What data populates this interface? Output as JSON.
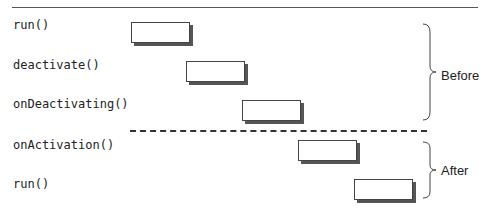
{
  "diagram": {
    "calls": [
      {
        "label": "run()",
        "phase": "Before"
      },
      {
        "label": "deactivate()",
        "phase": "Before"
      },
      {
        "label": "onDeactivating()",
        "phase": "Before"
      },
      {
        "label": "onActivation()",
        "phase": "After"
      },
      {
        "label": "run()",
        "phase": "After"
      }
    ],
    "phases": {
      "before": "Before",
      "after": "After"
    }
  }
}
